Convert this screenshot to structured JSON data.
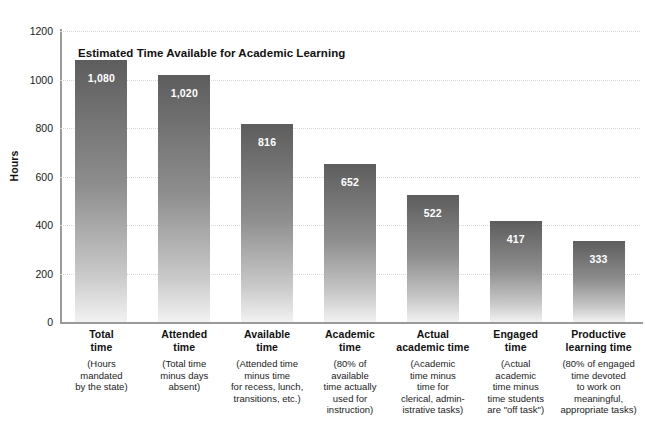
{
  "chart_data": {
    "type": "bar",
    "title": "Estimated Time Available for Academic Learning",
    "xlabel": "",
    "ylabel": "Hours",
    "ylim": [
      0,
      1200
    ],
    "yticks": [
      0,
      200,
      400,
      600,
      800,
      1000,
      1200
    ],
    "ytick_labels": [
      "0",
      "200",
      "400",
      "600",
      "800",
      "1000",
      "1200"
    ],
    "grid": "horizontal-dotted",
    "legend": "none",
    "categories": [
      "Total time",
      "Attended time",
      "Available time",
      "Academic time",
      "Actual academic time",
      "Engaged time",
      "Productive learning time"
    ],
    "values": [
      1080,
      1020,
      816,
      652,
      522,
      417,
      333
    ],
    "value_labels": [
      "1,080",
      "1,020",
      "816",
      "652",
      "522",
      "417",
      "333"
    ],
    "bars": [
      {
        "head": [
          "Total",
          "time"
        ],
        "sub": [
          "(Hours",
          "mandated",
          "by the state)"
        ],
        "value": 1080,
        "value_label": "1,080"
      },
      {
        "head": [
          "Attended",
          "time"
        ],
        "sub": [
          "(Total time",
          "minus days",
          "absent)"
        ],
        "value": 1020,
        "value_label": "1,020"
      },
      {
        "head": [
          "Available",
          "time"
        ],
        "sub": [
          "(Attended time",
          "minus time",
          "for recess, lunch,",
          "transitions, etc.)"
        ],
        "value": 816,
        "value_label": "816"
      },
      {
        "head": [
          "Academic",
          "time"
        ],
        "sub": [
          "(80% of",
          "available",
          "time actually",
          "used for",
          "instruction)"
        ],
        "value": 652,
        "value_label": "652"
      },
      {
        "head": [
          "Actual",
          "academic time"
        ],
        "sub": [
          "(Academic",
          "time minus",
          "time for",
          "clerical, admin-",
          "istrative tasks)"
        ],
        "value": 522,
        "value_label": "522"
      },
      {
        "head": [
          "Engaged",
          "time"
        ],
        "sub": [
          "(Actual",
          "academic",
          "time minus",
          "time students",
          "are \"off task\")"
        ],
        "value": 417,
        "value_label": "417"
      },
      {
        "head": [
          "Productive",
          "learning time"
        ],
        "sub": [
          "(80% of engaged",
          "time devoted",
          "to work on",
          "meaningful,",
          "appropriate tasks)"
        ],
        "value": 333,
        "value_label": "333"
      }
    ],
    "colors": {
      "bar_top": "#5d5d5d",
      "bar_bottom": "#f2f2f2",
      "value_text": "#ffffff",
      "gridline": "#d8d8d8",
      "axis": "#9a9a9a",
      "text": "#111111"
    }
  }
}
